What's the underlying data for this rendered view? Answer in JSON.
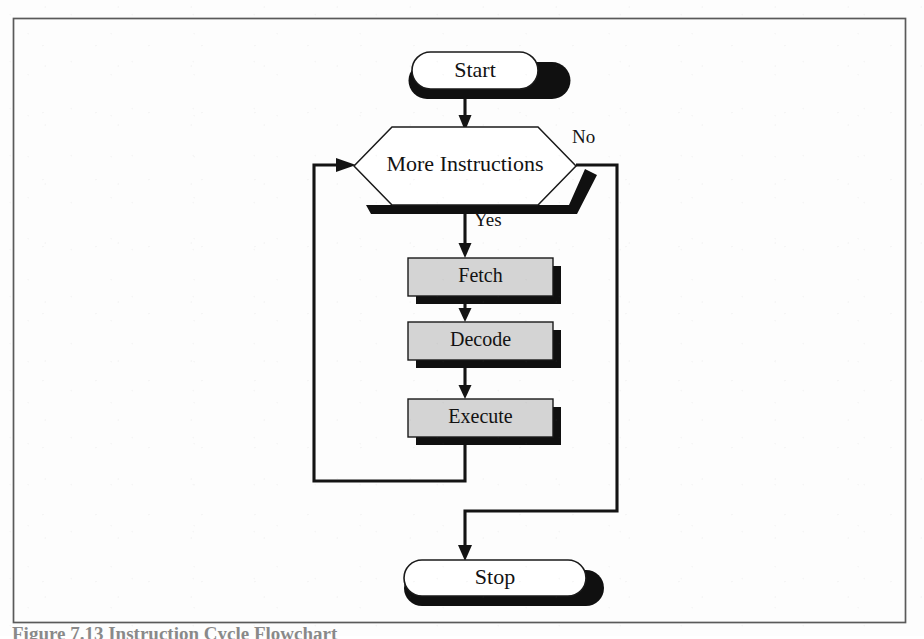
{
  "figure": {
    "title": "Instruction Cycle Flowchart",
    "caption": "Figure 7.13   Instruction Cycle Flowchart",
    "border_color": "#5a5a5a",
    "shadow_color": "#101010",
    "process_fill": "#d4d4d4",
    "terminator_fill": "#ffffff",
    "line_color": "#141414"
  },
  "nodes": [
    {
      "id": "start",
      "label": "Start",
      "shape": "terminator",
      "font_size": 22,
      "x": 412,
      "y": 52,
      "w": 126,
      "h": 37
    },
    {
      "id": "more_instructions",
      "label": "More Instructions",
      "shape": "decision-hexagon",
      "font_size": 22,
      "x": 354,
      "y": 127,
      "w": 222,
      "h": 78
    },
    {
      "id": "fetch",
      "label": "Fetch",
      "shape": "process",
      "font_size": 20,
      "x": 408,
      "y": 258,
      "w": 145,
      "h": 38
    },
    {
      "id": "decode",
      "label": "Decode",
      "shape": "process",
      "font_size": 20,
      "x": 408,
      "y": 322,
      "w": 145,
      "h": 38
    },
    {
      "id": "execute",
      "label": "Execute",
      "shape": "process",
      "font_size": 20,
      "x": 408,
      "y": 399,
      "w": 145,
      "h": 38
    },
    {
      "id": "stop",
      "label": "Stop",
      "shape": "terminator",
      "font_size": 22,
      "x": 404,
      "y": 560,
      "w": 182,
      "h": 36
    }
  ],
  "edges": [
    {
      "id": "start-to-decision",
      "from": "start",
      "to": "more_instructions",
      "label": ""
    },
    {
      "id": "decision-yes-to-fetch",
      "from": "more_instructions",
      "to": "fetch",
      "label": "Yes",
      "label_x": 474,
      "label_y": 222
    },
    {
      "id": "fetch-to-decode",
      "from": "fetch",
      "to": "decode",
      "label": ""
    },
    {
      "id": "decode-to-execute",
      "from": "decode",
      "to": "execute",
      "label": ""
    },
    {
      "id": "execute-loop-back",
      "from": "execute",
      "to": "more_instructions",
      "label": ""
    },
    {
      "id": "decision-no-to-stop",
      "from": "more_instructions",
      "to": "stop",
      "label": "No",
      "label_x": 572,
      "label_y": 139
    }
  ]
}
